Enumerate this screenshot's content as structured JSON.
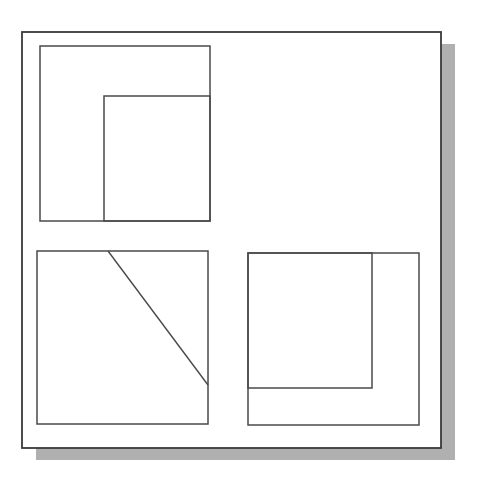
{
  "document": {
    "title": "Technical Line Diagram",
    "kind": "scanned-line-drawing",
    "canvas": {
      "width": 477,
      "height": 487
    },
    "background_color": "#ffffff",
    "stroke_color": "#4a4a4a",
    "stroke_color_dark": "#3a3a3a",
    "shadow_color": "#9a9a9a",
    "stroke_width": 1.6
  },
  "frame": {
    "label": "outer-frame",
    "x": 22,
    "y": 32,
    "width": 419,
    "height": 416,
    "shadow": {
      "label": "drop-shadow",
      "offset_x": 14,
      "offset_y": 12,
      "color": "#9a9a9a"
    }
  },
  "groups": [
    {
      "name": "top-left-group",
      "outer_rect": {
        "label": "top-left-outer-rect",
        "x": 40,
        "y": 46,
        "width": 170,
        "height": 175
      },
      "inner_rect": {
        "label": "top-left-inner-rect",
        "x": 104,
        "y": 96,
        "width": 106,
        "height": 125
      },
      "diagonal": null
    },
    {
      "name": "bottom-left-group",
      "outer_rect": {
        "label": "bottom-left-outer-rect",
        "x": 37,
        "y": 251,
        "width": 171,
        "height": 173
      },
      "inner_rect": null,
      "diagonal": {
        "label": "diagonal-line",
        "x1": 108,
        "y1": 251,
        "x2": 208,
        "y2": 385
      }
    },
    {
      "name": "bottom-right-group",
      "outer_rect": {
        "label": "bottom-right-outer-rect",
        "x": 248,
        "y": 253,
        "width": 171,
        "height": 172
      },
      "inner_rect": {
        "label": "bottom-right-inner-rect",
        "x": 248,
        "y": 253,
        "width": 124,
        "height": 135
      },
      "diagonal": null
    }
  ],
  "annotations": {
    "shape_count": "7",
    "line_count": "1",
    "caption": ""
  }
}
